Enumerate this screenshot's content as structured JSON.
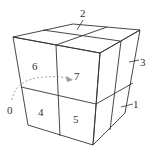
{
  "figure": {
    "labels": {
      "cube_0": "0",
      "cube_1": "1",
      "cube_2": "2",
      "cube_3": "3",
      "cube_4": "4",
      "cube_5": "5",
      "cube_6": "6",
      "cube_7": "7"
    },
    "colors": {
      "edge": "#333333",
      "dashed_arrow": "#9a9a9a"
    }
  }
}
